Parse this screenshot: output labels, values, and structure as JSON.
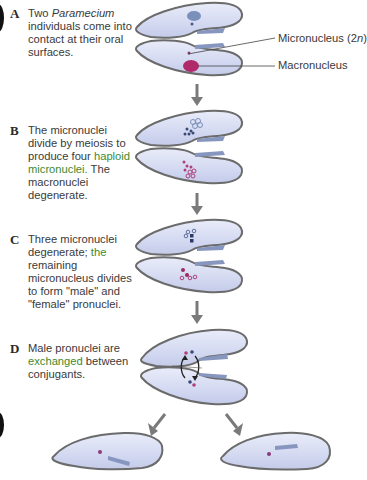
{
  "steps": [
    {
      "letter": "A",
      "text_pre": "Two ",
      "text_italic": "Paramecium",
      "text_post": " individuals come into contact at their oral surfaces."
    },
    {
      "letter": "B",
      "text_pre": "The micronuclei divide by meiosis to produce four ",
      "text_green": "haploid micronuclei.",
      "text_post": " The macronuclei degenerate."
    },
    {
      "letter": "C",
      "text_pre": "Three micronuclei degenerate; ",
      "text_green": "the",
      "text_post": " remaining micronucleus divides to form \"male\" and \"female\" pronuclei."
    },
    {
      "letter": "D",
      "text_pre": "Male pronuclei are ",
      "text_green": "exchanged",
      "text_post": " between conjugants."
    }
  ],
  "labels": {
    "micronucleus": "Micronucleus (2",
    "micronucleus_n": "n",
    "micronucleus_close": ")",
    "macronucleus": "Macronucleus"
  },
  "colors": {
    "cell_fill": "#d6dcf2",
    "cell_outline": "#6b6b6b",
    "micronucleus": "#5c6f99",
    "macronucleus": "#b02a6a",
    "arrow": "#7a7a7a",
    "green_text": "#3d8a2f"
  }
}
